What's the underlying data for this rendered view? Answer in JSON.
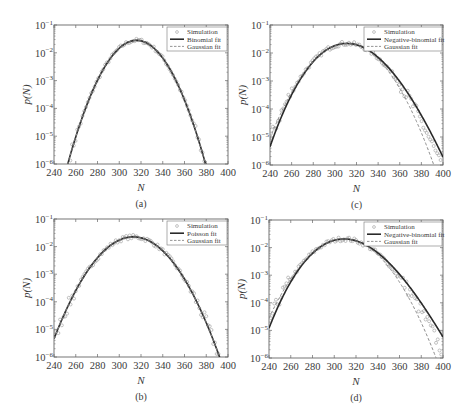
{
  "figure": {
    "colors": {
      "fit": "#2a2a2a",
      "gaussian": "#8a8a8a",
      "simulation": "#9a9a9a",
      "axis": "#666666",
      "legend_border": "#777777"
    }
  },
  "chart_data": [
    {
      "panel": "a",
      "type": "line",
      "caption": "(a)",
      "xlabel": "N",
      "ylabel": "p(N)",
      "yscale": "log",
      "xlim": [
        240,
        400
      ],
      "ylim": [
        1e-06,
        0.1
      ],
      "xticks": [
        240,
        260,
        280,
        300,
        320,
        340,
        360,
        380,
        400
      ],
      "yticks": [
        "10^-6",
        "10^-5",
        "10^-4",
        "10^-3",
        "10^-2",
        "10^-1"
      ],
      "legend": [
        "Simulation",
        "Binomial fit",
        "Gaussian fit"
      ],
      "legend_position": "upper right",
      "series": [
        {
          "name": "Binomial fit",
          "style": "solid",
          "mean": 316,
          "std": 14.0,
          "skew": 0.0
        },
        {
          "name": "Gaussian fit",
          "style": "dashed",
          "mean": 316,
          "std": 14.0,
          "skew": 0.0
        },
        {
          "name": "Simulation",
          "style": "markers",
          "mean": 316,
          "std": 14.0,
          "skew": 0.0,
          "scatter": 0.25,
          "x_range": [
            255,
            386
          ]
        }
      ],
      "peak": {
        "x": 316,
        "y": 0.028
      }
    },
    {
      "panel": "b",
      "type": "line",
      "caption": "(b)",
      "xlabel": "N",
      "ylabel": "p(N)",
      "yscale": "log",
      "xlim": [
        240,
        400
      ],
      "ylim": [
        1e-06,
        0.1
      ],
      "xticks": [
        240,
        260,
        280,
        300,
        320,
        340,
        360,
        380,
        400
      ],
      "yticks": [
        "10^-6",
        "10^-5",
        "10^-4",
        "10^-3",
        "10^-2",
        "10^-1"
      ],
      "legend": [
        "Simulation",
        "Poisson fit",
        "Gaussian fit"
      ],
      "legend_position": "upper right",
      "series": [
        {
          "name": "Poisson fit",
          "style": "solid",
          "mean": 313,
          "std": 17.7,
          "skew": 0.0
        },
        {
          "name": "Gaussian fit",
          "style": "dashed",
          "mean": 313,
          "std": 17.7,
          "skew": 0.0
        },
        {
          "name": "Simulation",
          "style": "markers",
          "mean": 313,
          "std": 17.7,
          "skew": 0.0,
          "scatter": 0.3,
          "x_range": [
            244,
            393
          ]
        }
      ],
      "peak": {
        "x": 313,
        "y": 0.0225
      }
    },
    {
      "panel": "c",
      "type": "line",
      "caption": "(c)",
      "xlabel": "N",
      "ylabel": "p(N)",
      "yscale": "log",
      "xlim": [
        240,
        400
      ],
      "ylim": [
        1e-06,
        0.1
      ],
      "xticks": [
        240,
        260,
        280,
        300,
        320,
        340,
        360,
        380,
        400
      ],
      "yticks": [
        "10^-6",
        "10^-5",
        "10^-4",
        "10^-3",
        "10^-2",
        "10^-1"
      ],
      "legend": [
        "Simulation",
        "Negative-binomial fit",
        "Gaussian fit"
      ],
      "legend_position": "upper right",
      "series": [
        {
          "name": "Negative-binomial fit",
          "style": "solid",
          "mean": 311,
          "std": 18.5,
          "skew": 0.12
        },
        {
          "name": "Gaussian fit",
          "style": "dashed",
          "mean": 311,
          "std": 18.0,
          "skew": 0.0
        },
        {
          "name": "Simulation",
          "style": "markers",
          "mean": 311,
          "std": 18.5,
          "skew": 0.06,
          "scatter": 0.3,
          "x_range": [
            241,
            398
          ]
        }
      ],
      "peak": {
        "x": 311,
        "y": 0.022
      }
    },
    {
      "panel": "d",
      "type": "line",
      "caption": "(d)",
      "xlabel": "N",
      "ylabel": "p(N)",
      "yscale": "log",
      "xlim": [
        240,
        400
      ],
      "ylim": [
        1e-06,
        0.1
      ],
      "xticks": [
        240,
        260,
        280,
        300,
        320,
        340,
        360,
        380,
        400
      ],
      "yticks": [
        "10^-6",
        "10^-5",
        "10^-4",
        "10^-3",
        "10^-2",
        "10^-1"
      ],
      "legend": [
        "Simulation",
        "Negative-binomial fit",
        "Gaussian fit"
      ],
      "legend_position": "upper right",
      "series": [
        {
          "name": "Negative-binomial fit",
          "style": "solid",
          "mean": 309,
          "std": 19.5,
          "skew": 0.16
        },
        {
          "name": "Gaussian fit",
          "style": "dashed",
          "mean": 309,
          "std": 19.0,
          "skew": 0.0
        },
        {
          "name": "Simulation",
          "style": "markers",
          "mean": 309,
          "std": 19.5,
          "skew": 0.08,
          "scatter": 0.3,
          "x_range": [
            240,
            399
          ]
        }
      ],
      "peak": {
        "x": 309,
        "y": 0.0205
      }
    }
  ],
  "layout": {
    "panels": [
      {
        "id": "a",
        "frame": {
          "left": 54,
          "top": 25,
          "right": 228,
          "bottom": 164
        }
      },
      {
        "id": "b",
        "frame": {
          "left": 54,
          "top": 219,
          "right": 228,
          "bottom": 357
        }
      },
      {
        "id": "c",
        "frame": {
          "left": 270,
          "top": 25,
          "right": 443,
          "bottom": 165
        }
      },
      {
        "id": "d",
        "frame": {
          "left": 269,
          "top": 220,
          "right": 443,
          "bottom": 358
        }
      }
    ]
  }
}
